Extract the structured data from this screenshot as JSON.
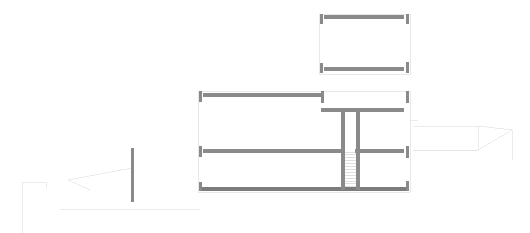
{
  "drawing": {
    "type": "architectural-floor-plan",
    "title": "",
    "canvas": {
      "width": 530,
      "height": 233
    },
    "background_color": "#ffffff",
    "wall_color": "#8a8a8a",
    "wall_dark_color": "#7c7c7c",
    "thin_line_color": "#c9c9c9",
    "faint_line_color": "#e2e2e2",
    "stair_tread_color": "#dcdcdc"
  },
  "upper_block": {
    "name": "upper-room-block",
    "bounds": {
      "x": 319,
      "y": 14,
      "width": 92,
      "height": 60
    },
    "walls": [
      {
        "name": "upper-top-wall",
        "orientation": "horizontal",
        "x1": 324,
        "y1": 17,
        "x2": 404,
        "y2": 17,
        "thickness": 3.5
      },
      {
        "name": "upper-bottom-wall",
        "orientation": "horizontal",
        "x1": 324,
        "y1": 69,
        "x2": 404,
        "y2": 69,
        "thickness": 3.5
      },
      {
        "name": "upper-left-jamb-top",
        "orientation": "vertical",
        "x1": 321,
        "y1": 14,
        "x2": 321,
        "y2": 24,
        "thickness": 3
      },
      {
        "name": "upper-left-jamb-bottom",
        "orientation": "vertical",
        "x1": 321,
        "y1": 63,
        "x2": 321,
        "y2": 73,
        "thickness": 3
      },
      {
        "name": "upper-right-jamb-top",
        "orientation": "vertical",
        "x1": 407,
        "y1": 14,
        "x2": 407,
        "y2": 24,
        "thickness": 3
      },
      {
        "name": "upper-right-jamb-bottom",
        "orientation": "vertical",
        "x1": 407,
        "y1": 62,
        "x2": 407,
        "y2": 73,
        "thickness": 3
      }
    ],
    "thin_outline": [
      {
        "name": "upper-left-thin-edge",
        "orientation": "vertical",
        "x1": 319,
        "y1": 14,
        "x2": 319,
        "y2": 74
      },
      {
        "name": "upper-right-thin-edge",
        "orientation": "vertical",
        "x1": 410,
        "y1": 14,
        "x2": 410,
        "y2": 74
      },
      {
        "name": "upper-top-thin-edge",
        "orientation": "horizontal",
        "x1": 319,
        "y1": 14,
        "x2": 410,
        "y2": 14
      },
      {
        "name": "upper-bottom-thin-edge",
        "orientation": "horizontal",
        "x1": 319,
        "y1": 74,
        "x2": 410,
        "y2": 74
      }
    ]
  },
  "main_block": {
    "name": "main-floor-block",
    "bounds": {
      "x": 198,
      "y": 91,
      "width": 212,
      "height": 103
    },
    "walls": [
      {
        "name": "main-top-left-wall",
        "orientation": "horizontal",
        "x1": 203,
        "y1": 95,
        "x2": 321,
        "y2": 95,
        "thickness": 3.5
      },
      {
        "name": "main-top-right-wall",
        "orientation": "horizontal",
        "x1": 321,
        "y1": 110,
        "x2": 404,
        "y2": 110,
        "thickness": 3.5
      },
      {
        "name": "main-mid-wall-left",
        "orientation": "horizontal",
        "x1": 203,
        "y1": 151,
        "x2": 341,
        "y2": 151,
        "thickness": 3.5
      },
      {
        "name": "main-mid-wall-right",
        "orientation": "horizontal",
        "x1": 355,
        "y1": 151,
        "x2": 404,
        "y2": 151,
        "thickness": 3.5
      },
      {
        "name": "main-bottom-wall",
        "orientation": "horizontal",
        "x1": 199,
        "y1": 189,
        "x2": 409,
        "y2": 189,
        "thickness": 4
      },
      {
        "name": "main-left-jamb-top",
        "orientation": "vertical",
        "x1": 200,
        "y1": 91,
        "x2": 200,
        "y2": 102,
        "thickness": 3
      },
      {
        "name": "main-left-jamb-mid",
        "orientation": "vertical",
        "x1": 200,
        "y1": 146,
        "x2": 200,
        "y2": 157,
        "thickness": 3
      },
      {
        "name": "main-left-jamb-bottom",
        "orientation": "vertical",
        "x1": 200,
        "y1": 182,
        "x2": 200,
        "y2": 191,
        "thickness": 3
      },
      {
        "name": "main-right-jamb-top",
        "orientation": "vertical",
        "x1": 407,
        "y1": 91,
        "x2": 407,
        "y2": 103,
        "thickness": 3
      },
      {
        "name": "main-right-jamb-mid",
        "orientation": "vertical",
        "x1": 407,
        "y1": 146,
        "x2": 407,
        "y2": 158,
        "thickness": 3
      },
      {
        "name": "main-right-jamb-bottom",
        "orientation": "vertical",
        "x1": 407,
        "y1": 181,
        "x2": 407,
        "y2": 191,
        "thickness": 3
      },
      {
        "name": "partition-wall-upper-right",
        "orientation": "vertical",
        "x1": 322,
        "y1": 91,
        "x2": 322,
        "y2": 103,
        "thickness": 3
      },
      {
        "name": "stair-wall-left",
        "orientation": "vertical",
        "x1": 343,
        "y1": 110,
        "x2": 343,
        "y2": 190,
        "thickness": 3.5
      },
      {
        "name": "stair-wall-right",
        "orientation": "vertical",
        "x1": 358,
        "y1": 110,
        "x2": 358,
        "y2": 190,
        "thickness": 3.5
      }
    ],
    "thin_outline": [
      {
        "name": "main-left-thin-edge",
        "orientation": "vertical",
        "x1": 198,
        "y1": 91,
        "x2": 198,
        "y2": 192
      },
      {
        "name": "main-right-thin-edge",
        "orientation": "vertical",
        "x1": 410,
        "y1": 91,
        "x2": 410,
        "y2": 192
      },
      {
        "name": "main-top-left-thin-edge",
        "orientation": "horizontal",
        "x1": 198,
        "y1": 91,
        "x2": 324,
        "y2": 91
      },
      {
        "name": "main-top-right-thin-edge",
        "orientation": "horizontal",
        "x1": 324,
        "y1": 91,
        "x2": 410,
        "y2": 91
      },
      {
        "name": "main-bottom-thin-edge",
        "orientation": "horizontal",
        "x1": 198,
        "y1": 192,
        "x2": 410,
        "y2": 192
      }
    ],
    "stair": {
      "name": "stair-run",
      "x": 344,
      "y": 152,
      "width": 13,
      "height": 37,
      "tread_count": 13,
      "tread_spacing": 2.9
    }
  },
  "standalone_wall": {
    "name": "isolated-vertical-wall",
    "orientation": "vertical",
    "x1": 132,
    "y1": 148,
    "x2": 132,
    "y2": 202,
    "thickness": 3
  },
  "construction_lines": {
    "name": "projection-construction-lines",
    "left_group": [
      {
        "name": "left-leader-upper",
        "points": "132,168 68,180"
      },
      {
        "name": "left-leader-lower",
        "points": "68,180 90,190"
      },
      {
        "name": "left-box-top",
        "points": "22,182 46,182"
      },
      {
        "name": "left-box-edge",
        "points": "22,182 22,233"
      },
      {
        "name": "left-box-step",
        "points": "46,182 46,188"
      },
      {
        "name": "left-baseline",
        "points": "60,209 200,209"
      }
    ],
    "right_group": [
      {
        "name": "right-frame-top",
        "points": "413,126 478,126"
      },
      {
        "name": "right-frame-slope",
        "points": "478,126 512,130"
      },
      {
        "name": "right-frame-right",
        "points": "512,130 512,160"
      },
      {
        "name": "right-frame-diag",
        "points": "478,150 512,130"
      },
      {
        "name": "right-frame-lower",
        "points": "413,150 478,150"
      },
      {
        "name": "right-edge-vertical",
        "points": "478,126 478,150"
      },
      {
        "name": "right-tail",
        "points": "478,150 413,150"
      },
      {
        "name": "right-stub-upper",
        "points": "410,120 418,120"
      }
    ]
  }
}
